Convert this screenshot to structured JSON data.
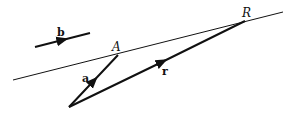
{
  "diagram": {
    "title": "",
    "labels": {
      "vector_b": "b",
      "point_A": "A",
      "vector_a": "a",
      "vector_r": "r",
      "point_R": "R"
    },
    "geometry": {
      "origin": [
        69,
        107
      ],
      "point_A": [
        118,
        55
      ],
      "point_R": [
        245,
        21
      ],
      "line_start": [
        13,
        80
      ],
      "line_end": [
        283,
        12
      ],
      "vector_b_start": [
        35,
        47
      ],
      "vector_b_end": [
        90,
        33
      ]
    },
    "colors": {
      "stroke": "#111111",
      "background": "#ffffff"
    }
  }
}
